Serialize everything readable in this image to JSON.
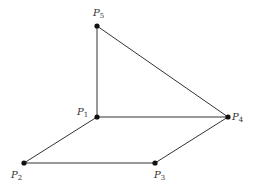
{
  "diagram": {
    "type": "geometric-figure",
    "points": [
      {
        "id": "P1",
        "label": "P",
        "sub": "1",
        "x": 97,
        "y": 117,
        "lx": 77,
        "ly": 115
      },
      {
        "id": "P2",
        "label": "P",
        "sub": "2",
        "x": 24,
        "y": 163,
        "lx": 11,
        "ly": 178
      },
      {
        "id": "P3",
        "label": "P",
        "sub": "3",
        "x": 155,
        "y": 163,
        "lx": 154,
        "ly": 178
      },
      {
        "id": "P4",
        "label": "P",
        "sub": "4",
        "x": 228,
        "y": 117,
        "lx": 232,
        "ly": 120
      },
      {
        "id": "P5",
        "label": "P",
        "sub": "5",
        "x": 97,
        "y": 26,
        "lx": 93,
        "ly": 16
      }
    ],
    "edges": [
      [
        "P5",
        "P1"
      ],
      [
        "P5",
        "P4"
      ],
      [
        "P1",
        "P4"
      ],
      [
        "P1",
        "P2"
      ],
      [
        "P2",
        "P3"
      ],
      [
        "P3",
        "P4"
      ]
    ]
  }
}
